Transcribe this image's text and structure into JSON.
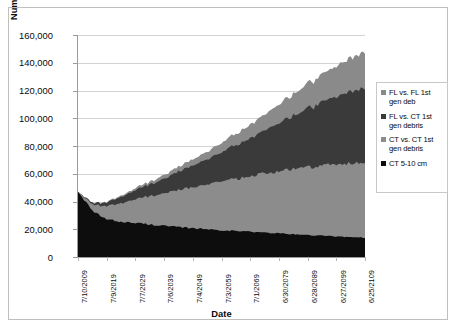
{
  "chart_data": {
    "type": "area",
    "stacked": true,
    "title": "",
    "subtitle": "",
    "xlabel": "Date",
    "ylabel": "Number of objects in LEO (curves stacked)",
    "ylim": [
      0,
      160000
    ],
    "ytick_labels": [
      "160,000",
      "140,000",
      "120,000",
      "100,000",
      "80,000",
      "60,000",
      "40,000",
      "20,000",
      "0"
    ],
    "ytick_values": [
      160000,
      140000,
      120000,
      100000,
      80000,
      60000,
      40000,
      20000,
      0
    ],
    "grid": true,
    "grid_axis": "y",
    "legend_position": "right",
    "xtick_labels": [
      "7/10/2009",
      "7/9/2019",
      "7/7/2029",
      "7/6/2039",
      "7/4/2049",
      "7/3/2059",
      "7/1/2069",
      "6/30/2079",
      "6/28/2089",
      "6/27/2099",
      "6/25/2109"
    ],
    "x_start_year": 2009,
    "x_end_year": 2109,
    "x_sample_years": [
      2009,
      2014,
      2019,
      2024,
      2029,
      2034,
      2039,
      2044,
      2049,
      2054,
      2059,
      2064,
      2069,
      2074,
      2079,
      2084,
      2089,
      2094,
      2099,
      2104,
      2109
    ],
    "series": [
      {
        "name": "CT 5-10 cm",
        "color": "#0d0d0d",
        "stack_order": 1,
        "values": [
          47000,
          33000,
          27000,
          25500,
          24500,
          23500,
          22500,
          21500,
          20800,
          20000,
          19400,
          18800,
          18200,
          17600,
          17000,
          16400,
          15800,
          15300,
          14800,
          14400,
          14000
        ]
      },
      {
        "name": "CT vs. CT 1st gen debris",
        "color": "#8c8c8c",
        "stack_order": 2,
        "values": [
          0,
          4500,
          9500,
          13500,
          17000,
          20500,
          23500,
          26500,
          29500,
          32500,
          35000,
          37500,
          40000,
          42500,
          45000,
          47000,
          49000,
          50500,
          52000,
          53000,
          54000
        ]
      },
      {
        "name": "FL vs. CT 1st gen debris",
        "color": "#3a3a3a",
        "stack_order": 3,
        "values": [
          0,
          1000,
          2500,
          4500,
          6500,
          8500,
          10500,
          13000,
          15500,
          18000,
          21000,
          24000,
          27500,
          31000,
          35000,
          38500,
          42000,
          46000,
          49000,
          52000,
          54000
        ]
      },
      {
        "name": "FL vs. FL 1st gen deb",
        "color": "#8a8a8a",
        "stack_order": 4,
        "values": [
          0,
          200,
          500,
          900,
          1400,
          2000,
          2700,
          3500,
          4500,
          5500,
          6800,
          8200,
          9800,
          11500,
          13500,
          15500,
          17800,
          20000,
          22200,
          24200,
          26000
        ]
      }
    ],
    "cumulative_totals": [
      47000,
      38700,
      39500,
      44400,
      49400,
      54500,
      59200,
      64500,
      70300,
      76000,
      82200,
      88500,
      95500,
      102600,
      110500,
      117400,
      124600,
      131800,
      138000,
      143600,
      148000
    ]
  },
  "legend": {
    "items": [
      {
        "label_line1": "FL vs. FL 1st",
        "label_line2": "gen deb",
        "color": "#8a8a8a",
        "marker": "square-swatch"
      },
      {
        "label_line1": "FL vs. CT 1st",
        "label_line2": "gen debris",
        "color": "#3a3a3a",
        "marker": "square-swatch"
      },
      {
        "label_line1": "CT vs. CT 1st",
        "label_line2": "gen debris",
        "color": "#8c8c8c",
        "marker": "square-swatch"
      },
      {
        "label_line1": "CT 5-10 cm",
        "label_line2": "",
        "color": "#0d0d0d",
        "marker": "square-swatch"
      }
    ]
  }
}
